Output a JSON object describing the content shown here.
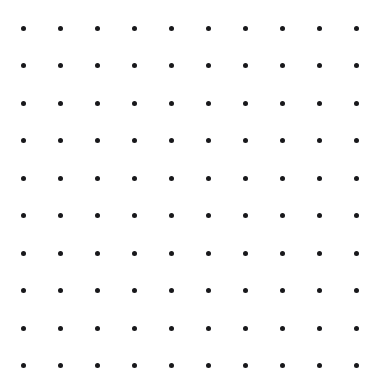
{
  "canvas": {
    "name": "dot-grid",
    "width": 381,
    "height": 384,
    "background_color": "#ffffff",
    "description": "Uniform square lattice of small round dots"
  },
  "grid": {
    "rows": 10,
    "columns": 10,
    "dot_count": 100,
    "dot_color": "#18181b",
    "dot_diameter_px": 5,
    "origin_x_px": 23,
    "origin_y_px": 28,
    "spacing_x_px": 37,
    "spacing_y_px": 37.5,
    "column_centers_x": [
      23,
      60,
      97,
      134,
      171,
      208,
      245,
      282,
      319,
      356
    ],
    "row_centers_y": [
      28,
      65.5,
      103,
      140.5,
      178,
      215.5,
      253,
      290.5,
      328,
      365.5
    ],
    "margins": {
      "left_px": 23,
      "top_px": 28,
      "right_px": 25,
      "bottom_px": 18
    }
  },
  "chart_data": {
    "type": "scatter",
    "title": "",
    "xlabel": "",
    "ylabel": "",
    "grid": false,
    "legend": null,
    "xlim": [
      0,
      381
    ],
    "ylim": [
      0,
      384
    ],
    "series": [
      {
        "name": "lattice-points",
        "marker": "circle",
        "color": "#18181b",
        "size_px": 5,
        "x": [
          23,
          60,
          97,
          134,
          171,
          208,
          245,
          282,
          319,
          356
        ],
        "y": [
          28,
          65.5,
          103,
          140.5,
          178,
          215.5,
          253,
          290.5,
          328,
          365.5
        ],
        "note": "Full cartesian product of x and y lists yields the 100 plotted points"
      }
    ]
  }
}
